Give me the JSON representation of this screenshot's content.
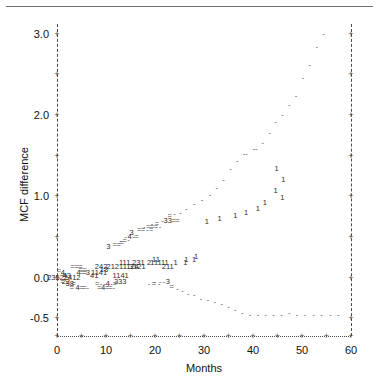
{
  "chart_data": {
    "type": "scatter",
    "title": "",
    "xlabel": "Months",
    "ylabel": "MCF difference",
    "xlim": [
      0,
      60
    ],
    "ylim": [
      -0.72,
      3.12
    ],
    "xticks": [
      0,
      5,
      10,
      15,
      20,
      25,
      30,
      35,
      40,
      45,
      50,
      55,
      60
    ],
    "xticklabels": [
      "0",
      "",
      "10",
      "",
      "20",
      "",
      "30",
      "",
      "40",
      "",
      "50",
      "",
      "60"
    ],
    "yticks": [
      -0.5,
      0.0,
      0.5,
      1.0,
      1.5,
      2.0,
      2.5,
      3.0
    ],
    "yticklabels": [
      "-0.5",
      "0.0",
      "",
      "1.0",
      "",
      "2.0",
      "",
      "3.0"
    ],
    "grid": false,
    "legend": null,
    "axis_style": {
      "left_axis": "dashed",
      "right_axis": "dashed",
      "bottom_axis": "dotted",
      "tick_marker": "+"
    },
    "marker_note": "Each plotted symbol is a digit giving the number of coincident observations; '-' and '=' denote single and double overplotted points.",
    "points": [
      {
        "x": 0.4,
        "y": 0.085,
        "t": "="
      },
      {
        "x": 1.2,
        "y": 0.055,
        "t": "4"
      },
      {
        "x": 1.6,
        "y": 0.02,
        "t": "="
      },
      {
        "x": 2.0,
        "y": 0.02,
        "t": "43"
      },
      {
        "x": 1.4,
        "y": -0.012,
        "t": "23522412"
      },
      {
        "x": 1.1,
        "y": -0.05,
        "t": "="
      },
      {
        "x": 1.8,
        "y": -0.05,
        "t": "22"
      },
      {
        "x": 2.6,
        "y": -0.085,
        "t": "38"
      },
      {
        "x": 3.4,
        "y": -0.085,
        "t": "="
      },
      {
        "x": 3.0,
        "y": -0.125,
        "t": "="
      },
      {
        "x": 4.2,
        "y": -0.125,
        "t": "4"
      },
      {
        "x": 5.0,
        "y": -0.125,
        "t": "="
      },
      {
        "x": 5.6,
        "y": -0.125,
        "t": "="
      },
      {
        "x": 6.3,
        "y": -0.125,
        "t": "-"
      },
      {
        "x": 4.4,
        "y": 0.055,
        "t": "4"
      },
      {
        "x": 5.1,
        "y": 0.055,
        "t": "="
      },
      {
        "x": 5.7,
        "y": 0.055,
        "t": "="
      },
      {
        "x": 6.3,
        "y": 0.055,
        "t": "3"
      },
      {
        "x": 4.8,
        "y": 0.095,
        "t": "="
      },
      {
        "x": 5.6,
        "y": 0.095,
        "t": "="
      },
      {
        "x": 3.2,
        "y": 0.135,
        "t": "="
      },
      {
        "x": 4.0,
        "y": 0.135,
        "t": "="
      },
      {
        "x": 4.8,
        "y": 0.135,
        "t": "="
      },
      {
        "x": 7.6,
        "y": 0.02,
        "t": "41"
      },
      {
        "x": 8.6,
        "y": 0.055,
        "t": "1141"
      },
      {
        "x": 9.6,
        "y": 0.095,
        "t": "13"
      },
      {
        "x": 9.0,
        "y": 0.135,
        "t": "242"
      },
      {
        "x": 8.2,
        "y": -0.085,
        "t": "="
      },
      {
        "x": 9.0,
        "y": -0.085,
        "t": "-"
      },
      {
        "x": 9.7,
        "y": -0.085,
        "t": "-"
      },
      {
        "x": 10.4,
        "y": -0.085,
        "t": "4"
      },
      {
        "x": 11.1,
        "y": -0.085,
        "t": "-"
      },
      {
        "x": 11.8,
        "y": -0.085,
        "t": "="
      },
      {
        "x": 8.6,
        "y": -0.125,
        "t": "="
      },
      {
        "x": 9.4,
        "y": -0.125,
        "t": "4"
      },
      {
        "x": 10.2,
        "y": -0.125,
        "t": "="
      },
      {
        "x": 10.9,
        "y": -0.125,
        "t": "="
      },
      {
        "x": 11.6,
        "y": -0.125,
        "t": "-"
      },
      {
        "x": 12.9,
        "y": -0.05,
        "t": "333"
      },
      {
        "x": 13.0,
        "y": 0.02,
        "t": "1141"
      },
      {
        "x": 13.8,
        "y": 0.175,
        "t": "111"
      },
      {
        "x": 13.4,
        "y": 0.135,
        "t": "21211124"
      },
      {
        "x": 16.6,
        "y": 0.175,
        "t": "231"
      },
      {
        "x": 16.4,
        "y": 0.135,
        "t": "3121"
      },
      {
        "x": 18.8,
        "y": 0.175,
        "t": "2"
      },
      {
        "x": 20.2,
        "y": 0.175,
        "t": "111"
      },
      {
        "x": 20.2,
        "y": 0.215,
        "t": "11"
      },
      {
        "x": 22.0,
        "y": 0.175,
        "t": "11"
      },
      {
        "x": 22.6,
        "y": 0.135,
        "t": "211"
      },
      {
        "x": 24.2,
        "y": 0.175,
        "t": "1"
      },
      {
        "x": 26.4,
        "y": 0.215,
        "t": "1"
      },
      {
        "x": 26.2,
        "y": 0.175,
        "t": "1"
      },
      {
        "x": 28.0,
        "y": 0.215,
        "t": "1"
      },
      {
        "x": 28.4,
        "y": 0.255,
        "t": "1"
      },
      {
        "x": 10.5,
        "y": 0.38,
        "t": "3"
      },
      {
        "x": 11.8,
        "y": 0.4,
        "t": "="
      },
      {
        "x": 12.6,
        "y": 0.4,
        "t": "="
      },
      {
        "x": 13.2,
        "y": 0.42,
        "t": "="
      },
      {
        "x": 13.0,
        "y": 0.45,
        "t": "-"
      },
      {
        "x": 13.8,
        "y": 0.45,
        "t": "="
      },
      {
        "x": 14.6,
        "y": 0.46,
        "t": "-"
      },
      {
        "x": 14.0,
        "y": 0.5,
        "t": "-"
      },
      {
        "x": 14.8,
        "y": 0.5,
        "t": "4"
      },
      {
        "x": 15.6,
        "y": 0.5,
        "t": "-"
      },
      {
        "x": 16.2,
        "y": 0.5,
        "t": "="
      },
      {
        "x": 15.2,
        "y": 0.55,
        "t": "3"
      },
      {
        "x": 16.8,
        "y": 0.58,
        "t": "="
      },
      {
        "x": 17.6,
        "y": 0.58,
        "t": "="
      },
      {
        "x": 18.4,
        "y": 0.58,
        "t": "-"
      },
      {
        "x": 19.2,
        "y": 0.58,
        "t": "="
      },
      {
        "x": 17.8,
        "y": 0.62,
        "t": "-"
      },
      {
        "x": 18.6,
        "y": 0.62,
        "t": "="
      },
      {
        "x": 19.4,
        "y": 0.62,
        "t": "="
      },
      {
        "x": 20.2,
        "y": 0.62,
        "t": "="
      },
      {
        "x": 21.0,
        "y": 0.62,
        "t": "-"
      },
      {
        "x": 19.4,
        "y": 0.66,
        "t": "-"
      },
      {
        "x": 20.4,
        "y": 0.66,
        "t": "="
      },
      {
        "x": 21.6,
        "y": 0.7,
        "t": "-"
      },
      {
        "x": 22.6,
        "y": 0.7,
        "t": "33"
      },
      {
        "x": 23.8,
        "y": 0.7,
        "t": "="
      },
      {
        "x": 24.6,
        "y": 0.7,
        "t": "="
      },
      {
        "x": 23.0,
        "y": 0.76,
        "t": "="
      },
      {
        "x": 24.0,
        "y": 0.78,
        "t": "-"
      },
      {
        "x": 25.2,
        "y": 0.8,
        "t": "-"
      },
      {
        "x": 26.4,
        "y": 0.84,
        "t": "-"
      },
      {
        "x": 28.0,
        "y": 0.9,
        "t": "-"
      },
      {
        "x": 29.6,
        "y": 0.96,
        "t": "-"
      },
      {
        "x": 31.2,
        "y": 1.02,
        "t": "-"
      },
      {
        "x": 32.6,
        "y": 1.1,
        "t": "-"
      },
      {
        "x": 34.0,
        "y": 1.2,
        "t": "-"
      },
      {
        "x": 35.4,
        "y": 1.34,
        "t": "-"
      },
      {
        "x": 36.8,
        "y": 1.44,
        "t": "-"
      },
      {
        "x": 38.4,
        "y": 1.52,
        "t": "--"
      },
      {
        "x": 40.4,
        "y": 1.58,
        "t": "--"
      },
      {
        "x": 42.0,
        "y": 1.66,
        "t": "-"
      },
      {
        "x": 43.4,
        "y": 1.78,
        "t": "-"
      },
      {
        "x": 44.6,
        "y": 1.92,
        "t": "-"
      },
      {
        "x": 46.0,
        "y": 2.0,
        "t": "-"
      },
      {
        "x": 47.4,
        "y": 2.12,
        "t": "-"
      },
      {
        "x": 48.8,
        "y": 2.24,
        "t": "-"
      },
      {
        "x": 50.2,
        "y": 2.46,
        "t": "-"
      },
      {
        "x": 51.6,
        "y": 2.62,
        "t": "-"
      },
      {
        "x": 53.0,
        "y": 2.84,
        "t": "-"
      },
      {
        "x": 54.4,
        "y": 3.0,
        "t": "-"
      },
      {
        "x": 44.8,
        "y": 1.34,
        "t": "1"
      },
      {
        "x": 46.2,
        "y": 1.2,
        "t": "1"
      },
      {
        "x": 44.6,
        "y": 1.06,
        "t": "1"
      },
      {
        "x": 46.0,
        "y": 0.98,
        "t": "1"
      },
      {
        "x": 42.4,
        "y": 0.92,
        "t": "1"
      },
      {
        "x": 41.0,
        "y": 0.84,
        "t": "1"
      },
      {
        "x": 38.6,
        "y": 0.8,
        "t": "1"
      },
      {
        "x": 36.4,
        "y": 0.76,
        "t": "1"
      },
      {
        "x": 33.2,
        "y": 0.72,
        "t": "1"
      },
      {
        "x": 30.6,
        "y": 0.68,
        "t": "1"
      },
      {
        "x": 20.0,
        "y": -0.05,
        "t": "-"
      },
      {
        "x": 21.0,
        "y": -0.05,
        "t": "-"
      },
      {
        "x": 21.8,
        "y": -0.05,
        "t": "-"
      },
      {
        "x": 22.6,
        "y": -0.05,
        "t": "3"
      },
      {
        "x": 18.8,
        "y": -0.085,
        "t": "-"
      },
      {
        "x": 19.8,
        "y": -0.085,
        "t": "="
      },
      {
        "x": 20.8,
        "y": -0.085,
        "t": "-"
      },
      {
        "x": 23.4,
        "y": -0.12,
        "t": "="
      },
      {
        "x": 24.6,
        "y": -0.14,
        "t": "-"
      },
      {
        "x": 25.6,
        "y": -0.16,
        "t": "-"
      },
      {
        "x": 26.8,
        "y": -0.2,
        "t": "-"
      },
      {
        "x": 28.0,
        "y": -0.22,
        "t": "-"
      },
      {
        "x": 29.4,
        "y": -0.26,
        "t": "-"
      },
      {
        "x": 30.8,
        "y": -0.28,
        "t": "-"
      },
      {
        "x": 32.2,
        "y": -0.3,
        "t": "-"
      },
      {
        "x": 33.6,
        "y": -0.32,
        "t": "-"
      },
      {
        "x": 35.0,
        "y": -0.36,
        "t": "-"
      },
      {
        "x": 36.4,
        "y": -0.4,
        "t": "-"
      },
      {
        "x": 37.8,
        "y": -0.44,
        "t": "-"
      },
      {
        "x": 39.4,
        "y": -0.46,
        "t": "-"
      },
      {
        "x": 41.0,
        "y": -0.46,
        "t": "-"
      },
      {
        "x": 42.6,
        "y": -0.46,
        "t": "-"
      },
      {
        "x": 44.2,
        "y": -0.46,
        "t": "-"
      },
      {
        "x": 45.8,
        "y": -0.46,
        "t": "-"
      },
      {
        "x": 47.4,
        "y": -0.44,
        "t": "-"
      },
      {
        "x": 49.0,
        "y": -0.46,
        "t": "-"
      },
      {
        "x": 50.6,
        "y": -0.46,
        "t": "-"
      },
      {
        "x": 52.4,
        "y": -0.46,
        "t": "-"
      },
      {
        "x": 54.0,
        "y": -0.46,
        "t": "-"
      },
      {
        "x": 55.8,
        "y": -0.46,
        "t": "-"
      },
      {
        "x": 57.4,
        "y": -0.46,
        "t": "-"
      }
    ]
  }
}
